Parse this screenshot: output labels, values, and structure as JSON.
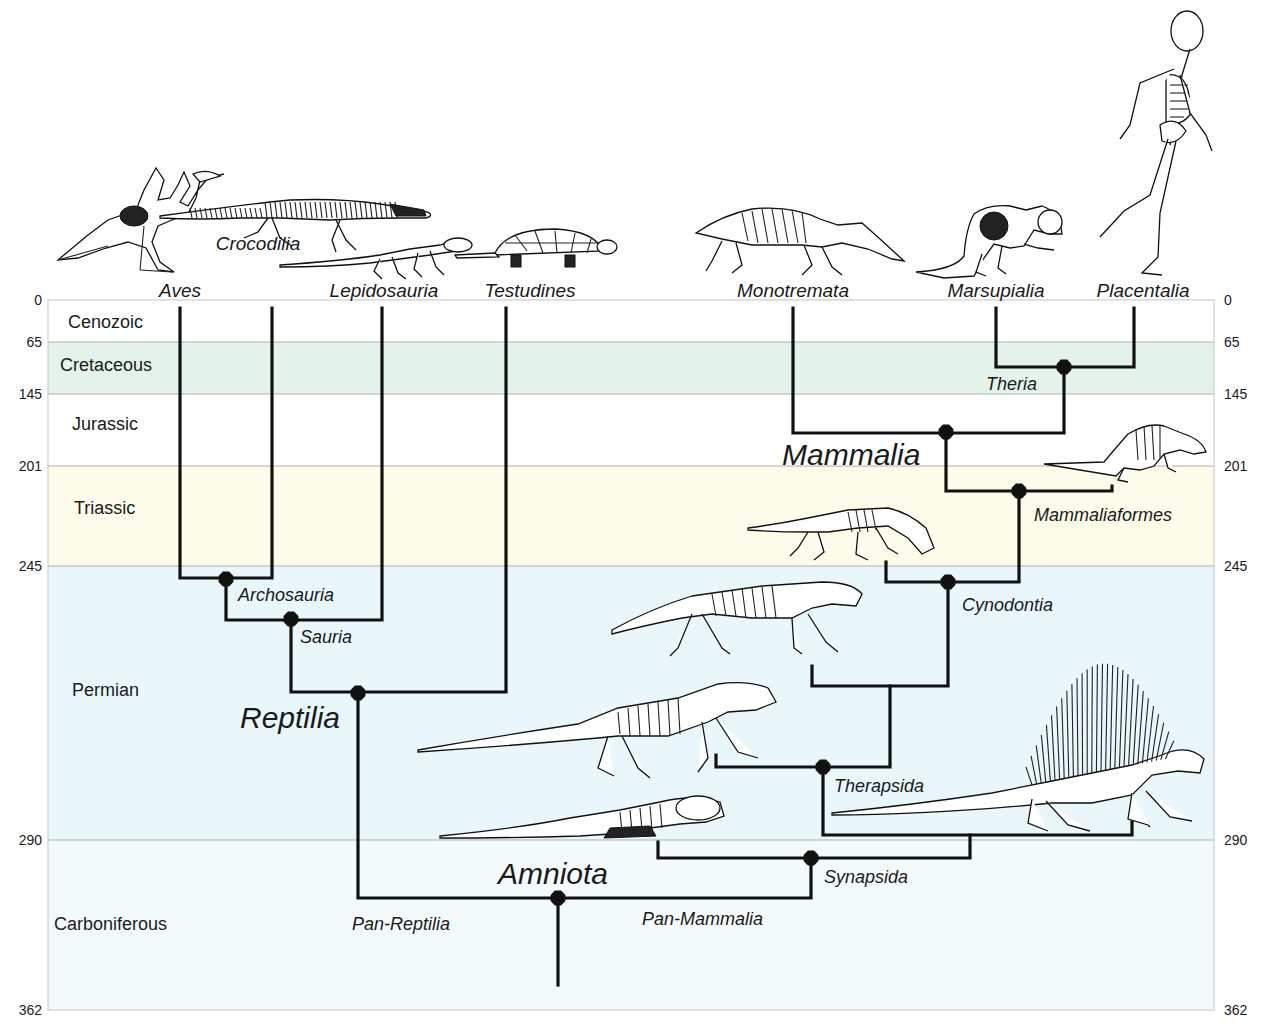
{
  "figure": {
    "width": 1264,
    "height": 1033,
    "plot_area": {
      "x0": 48,
      "x1": 1214
    },
    "colors": {
      "branch": "#111111",
      "node": "#111111",
      "cenozoic_band": "#ffffff",
      "cretaceous_band": "#e3f3ea",
      "jurassic_band": "#ffffff",
      "triassic_band": "#fdfbea",
      "permian_band": "#e9f6fa",
      "carboniferous_band": "#f3fafc"
    }
  },
  "time_axis": {
    "unit": "Ma",
    "ticks": [
      {
        "label": "0",
        "y": 300
      },
      {
        "label": "65",
        "y": 342
      },
      {
        "label": "145",
        "y": 394
      },
      {
        "label": "201",
        "y": 466
      },
      {
        "label": "245",
        "y": 566
      },
      {
        "label": "290",
        "y": 840
      },
      {
        "label": "362",
        "y": 1010
      }
    ]
  },
  "periods": [
    {
      "name": "Cenozoic",
      "y_top": 300,
      "y_bottom": 342,
      "label_x": 68,
      "label_y": 328,
      "color": "#ffffff"
    },
    {
      "name": "Cretaceous",
      "y_top": 342,
      "y_bottom": 394,
      "label_x": 60,
      "label_y": 371,
      "color": "#e3f3ea"
    },
    {
      "name": "Jurassic",
      "y_top": 394,
      "y_bottom": 466,
      "label_x": 72,
      "label_y": 430,
      "color": "#ffffff"
    },
    {
      "name": "Triassic",
      "y_top": 466,
      "y_bottom": 566,
      "label_x": 74,
      "label_y": 514,
      "color": "#fdfbea"
    },
    {
      "name": "Permian",
      "y_top": 566,
      "y_bottom": 840,
      "label_x": 72,
      "label_y": 696,
      "color": "#e9f6fa"
    },
    {
      "name": "Carboniferous",
      "y_top": 840,
      "y_bottom": 1010,
      "label_x": 54,
      "label_y": 930,
      "color": "#f3fafc"
    }
  ],
  "taxa": [
    {
      "name": "Aves",
      "x": 180,
      "label_y": 297
    },
    {
      "name": "Crocodilia",
      "x": 258,
      "label_y": 250
    },
    {
      "name": "Lepidosauria",
      "x": 384,
      "label_y": 297
    },
    {
      "name": "Testudines",
      "x": 530,
      "label_y": 297
    },
    {
      "name": "Monotremata",
      "x": 793,
      "label_y": 297
    },
    {
      "name": "Marsupialia",
      "x": 996,
      "label_y": 297
    },
    {
      "name": "Placentalia",
      "x": 1143,
      "label_y": 297
    }
  ],
  "clades": [
    {
      "name": "Archosauria",
      "node_x": 226,
      "node_y": 579,
      "label_x": 238,
      "label_y": 601,
      "size": "small"
    },
    {
      "name": "Sauria",
      "node_x": 291,
      "node_y": 619,
      "label_x": 300,
      "label_y": 643,
      "size": "small"
    },
    {
      "name": "Reptilia",
      "node_x": 358,
      "node_y": 693,
      "label_x": 240,
      "label_y": 728,
      "size": "big"
    },
    {
      "name": "Amniota",
      "node_x": 558,
      "node_y": 898,
      "label_x": 498,
      "label_y": 884,
      "size": "big"
    },
    {
      "name": "Pan-Reptilia",
      "node_x": null,
      "node_y": null,
      "label_x": 352,
      "label_y": 930,
      "size": "small"
    },
    {
      "name": "Pan-Mammalia",
      "node_x": null,
      "node_y": null,
      "label_x": 642,
      "label_y": 925,
      "size": "small"
    },
    {
      "name": "Synapsida",
      "node_x": 811,
      "node_y": 858,
      "label_x": 824,
      "label_y": 883,
      "size": "small"
    },
    {
      "name": "Therapsida",
      "node_x": 823,
      "node_y": 767,
      "label_x": 834,
      "label_y": 792,
      "size": "small"
    },
    {
      "name": "Cynodontia",
      "node_x": 948,
      "node_y": 582,
      "label_x": 962,
      "label_y": 611,
      "size": "small"
    },
    {
      "name": "Mammaliaformes",
      "node_x": 1019,
      "node_y": 491,
      "label_x": 1034,
      "label_y": 521,
      "size": "small"
    },
    {
      "name": "Mammalia",
      "node_x": 946,
      "node_y": 432,
      "label_x": 782,
      "label_y": 465,
      "size": "big"
    },
    {
      "name": "Theria",
      "node_x": 1064,
      "node_y": 367,
      "label_x": 986,
      "label_y": 390,
      "size": "small"
    }
  ],
  "branches": [
    "M180,308 V578 H272 V308",
    "M226,578 V620 H382 V308",
    "M291,620 V692 H506 V308",
    "M358,692 V898 H811 V858",
    "M558,898 V985",
    "M658,842 V858 H970 V835",
    "M823,767 V835 H1132 V822",
    "M716,755 V767 H890 V686",
    "M812,666 V686 H948 V582",
    "M886,562 V582 H1019 V491",
    "M946,432 V491 H1112 V486",
    "M793,308 V433 H1064 V367",
    "M996,308 V367 H1134 V308"
  ],
  "illustrations": [
    {
      "name": "aves-skeleton",
      "x": 48,
      "y": 150
    },
    {
      "name": "crocodilia-skeleton",
      "x": 160,
      "y": 180
    },
    {
      "name": "lepidosauria-skeleton",
      "x": 280,
      "y": 235
    },
    {
      "name": "testudines-skeleton",
      "x": 455,
      "y": 225
    },
    {
      "name": "monotremata-skeleton",
      "x": 692,
      "y": 195
    },
    {
      "name": "marsupialia-skeleton",
      "x": 914,
      "y": 198
    },
    {
      "name": "placentalia-skeleton",
      "x": 1090,
      "y": 5
    },
    {
      "name": "mammaliaform-skeleton",
      "x": 1044,
      "y": 420
    },
    {
      "name": "early-cynodont-skeleton",
      "x": 748,
      "y": 498
    },
    {
      "name": "cynodont-skeleton",
      "x": 612,
      "y": 578
    },
    {
      "name": "therapsid-skeleton",
      "x": 418,
      "y": 672
    },
    {
      "name": "dimetrodon-skeleton",
      "x": 832,
      "y": 655
    },
    {
      "name": "basal-synapsid-skeleton",
      "x": 440,
      "y": 788
    }
  ]
}
